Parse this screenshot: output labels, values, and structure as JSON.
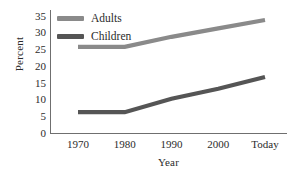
{
  "chart_data": {
    "type": "line",
    "title": "",
    "xlabel": "Year",
    "ylabel": "Percent",
    "categories": [
      "1970",
      "1980",
      "1990",
      "2000",
      "Today"
    ],
    "series": [
      {
        "name": "Adults",
        "color": "#8a8a8a",
        "values": [
          26,
          26,
          29,
          31.5,
          34
        ]
      },
      {
        "name": "Children",
        "color": "#555555",
        "values": [
          6.5,
          6.5,
          10.5,
          13.5,
          17
        ]
      }
    ],
    "ylim": [
      0,
      37
    ],
    "yticks": [
      "0",
      "5",
      "10",
      "15",
      "20",
      "25",
      "30",
      "35"
    ],
    "ytick_values": [
      0,
      5,
      10,
      15,
      20,
      25,
      30,
      35
    ],
    "grid": false,
    "legend_position": "upper left",
    "axis_color": "#6f6f6f"
  }
}
